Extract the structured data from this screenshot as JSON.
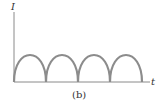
{
  "figure": {
    "caption": "(b)",
    "y_axis_label": "I",
    "x_axis_label": "t",
    "waveform": "full-wave rectified sine",
    "num_humps": 4,
    "colors": {
      "axis": "#8a8a8a",
      "waveform": "#8c8c8c",
      "text": "#333333"
    }
  }
}
